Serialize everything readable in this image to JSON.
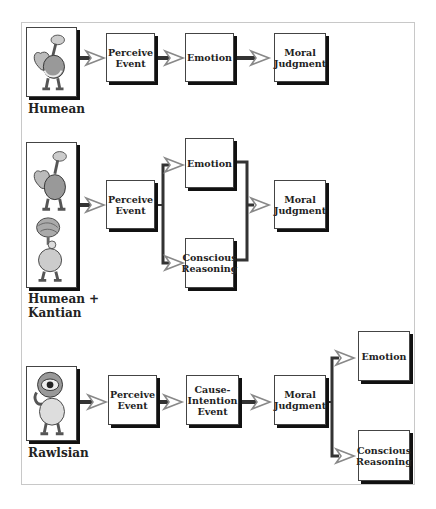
{
  "diagram": {
    "colors": {
      "box_border": "#444444",
      "shadow": "#111111",
      "wire": "#333333",
      "arrowhead": "#888888",
      "frame": "#c8c8c8"
    },
    "rows": [
      {
        "name": "Humean",
        "label": "Humean",
        "figure_icons": [
          "heart-creature-icon"
        ],
        "nodes": [
          {
            "id": "perceive",
            "label": "Perceive\nEvent"
          },
          {
            "id": "emotion",
            "label": "Emotion"
          },
          {
            "id": "moral",
            "label": "Moral\nJudgment"
          }
        ],
        "edges": [
          [
            "figure",
            "perceive"
          ],
          [
            "perceive",
            "emotion"
          ],
          [
            "emotion",
            "moral"
          ]
        ]
      },
      {
        "name": "Humean + Kantian",
        "label_line1": "Humean +",
        "label_line2": "Kantian",
        "figure_icons": [
          "heart-creature-icon",
          "brain-creature-icon"
        ],
        "nodes": [
          {
            "id": "perceive",
            "label": "Perceive\nEvent"
          },
          {
            "id": "emotion",
            "label": "Emotion"
          },
          {
            "id": "reasoning",
            "label": "Conscious\nReasoning"
          },
          {
            "id": "moral",
            "label": "Moral\nJudgment"
          }
        ],
        "edges": [
          [
            "figure",
            "perceive"
          ],
          [
            "perceive",
            "emotion"
          ],
          [
            "perceive",
            "reasoning"
          ],
          [
            "emotion",
            "moral"
          ],
          [
            "reasoning",
            "moral"
          ]
        ]
      },
      {
        "name": "Rawlsian",
        "label": "Rawlsian",
        "figure_icons": [
          "eye-creature-icon"
        ],
        "nodes": [
          {
            "id": "perceive",
            "label": "Perceive\nEvent"
          },
          {
            "id": "cause",
            "label": "Cause-\nIntention\nEvent"
          },
          {
            "id": "moral",
            "label": "Moral\nJudgment"
          },
          {
            "id": "emotion",
            "label": "Emotion"
          },
          {
            "id": "reasoning",
            "label": "Conscious\nReasoning"
          }
        ],
        "edges": [
          [
            "figure",
            "perceive"
          ],
          [
            "perceive",
            "cause"
          ],
          [
            "cause",
            "moral"
          ],
          [
            "moral",
            "emotion"
          ],
          [
            "moral",
            "reasoning"
          ]
        ]
      }
    ]
  }
}
